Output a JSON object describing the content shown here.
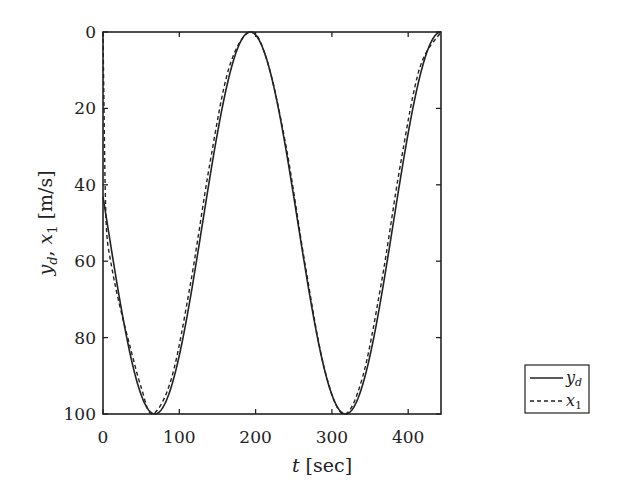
{
  "chart_data": {
    "type": "line",
    "title": "",
    "xlabel": "t [sec]",
    "ylabel": "y_d, x_1 [m/s]",
    "xlim": [
      0,
      443
    ],
    "ylim": [
      100,
      0
    ],
    "y_axis_inverted": true,
    "grid": false,
    "legend_position": "lower right",
    "x_ticks": [
      0,
      100,
      200,
      300,
      400
    ],
    "y_ticks": [
      0,
      20,
      40,
      60,
      80,
      100
    ],
    "series": [
      {
        "name": "y_d",
        "style": "solid",
        "x": [
          0,
          65,
          90,
          115,
          140,
          165,
          193,
          215,
          240,
          265,
          290,
          315,
          340,
          365,
          390,
          415,
          443
        ],
        "y": [
          0,
          100,
          90.5,
          65.5,
          34.5,
          9.5,
          0,
          7.5,
          30,
          61,
          88,
          100,
          90.5,
          65.5,
          34.5,
          9.5,
          0
        ]
      },
      {
        "name": "x_1",
        "style": "dashed",
        "x": [
          0,
          1,
          2,
          3,
          5,
          10,
          20,
          35,
          50,
          65,
          90,
          115,
          140,
          165,
          193,
          215,
          240,
          265,
          290,
          315,
          340,
          365,
          390,
          415,
          443
        ],
        "y": [
          0,
          15,
          30,
          42,
          53,
          60,
          70,
          82,
          93,
          100,
          90.5,
          65.5,
          34.5,
          9.5,
          0,
          7.5,
          30,
          61,
          88,
          100,
          90.5,
          65.5,
          34.5,
          9.5,
          0
        ]
      }
    ]
  },
  "labels": {
    "xlabel_var": "t",
    "xlabel_unit": "[sec]",
    "ylabel_y": "y",
    "ylabel_y_sub": "d",
    "ylabel_sep": ", ",
    "ylabel_x": "x",
    "ylabel_x_sub": "1",
    "ylabel_unit": "[m/s]",
    "legend_1": "y",
    "legend_1_sub": "d",
    "legend_2": "x",
    "legend_2_sub": "1"
  },
  "colors": {
    "line": "#222222",
    "axis": "#222222",
    "background": "#ffffff"
  }
}
